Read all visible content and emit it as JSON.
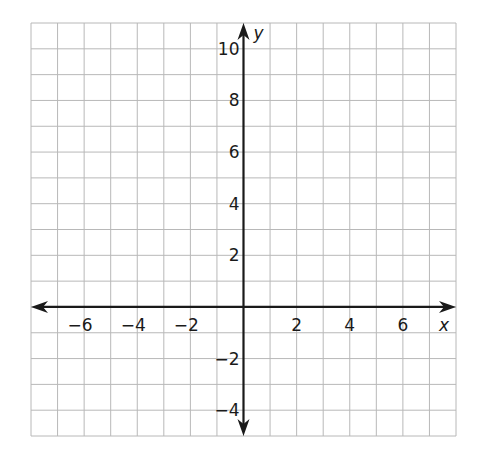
{
  "chart_data": {
    "type": "coordinate-grid",
    "title": "",
    "xlabel": "x",
    "ylabel": "y",
    "xlim": [
      -8,
      8
    ],
    "ylim": [
      -5,
      11
    ],
    "grid": true,
    "grid_step": 1,
    "x_ticks": [
      -6,
      -4,
      -2,
      2,
      4,
      6
    ],
    "y_ticks": [
      -4,
      -2,
      2,
      4,
      6,
      8,
      10
    ],
    "x_tick_labels": [
      "−6",
      "−4",
      "−2",
      "2",
      "4",
      "6"
    ],
    "y_tick_labels": [
      "−4",
      "−2",
      "2",
      "4",
      "6",
      "8",
      "10"
    ],
    "axes_arrows": {
      "x": "both",
      "y": "both"
    },
    "series": [],
    "legend": null
  },
  "style": {
    "grid_color": "#b8b8b8",
    "axis_color": "#1a1a1a",
    "background": "#ffffff"
  },
  "layout": {
    "grid_left": 31,
    "grid_top": 23,
    "grid_right": 456,
    "grid_bottom": 436
  }
}
